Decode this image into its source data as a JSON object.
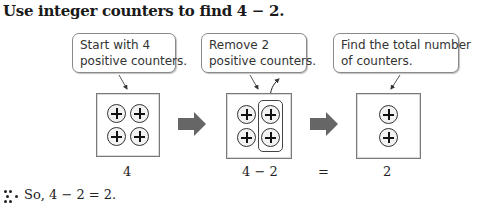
{
  "heading": "Use integer counters to find 4 − 2.",
  "steps": [
    {
      "callout_lines": [
        "Start with 4",
        "positive counters."
      ],
      "counters": [
        "+",
        "+",
        "+",
        "+"
      ],
      "label": "4"
    },
    {
      "callout_lines": [
        "Remove 2",
        "positive counters."
      ],
      "counters": [
        "+",
        "+",
        "+",
        "+"
      ],
      "removed_group": [
        "+",
        "+"
      ],
      "label": "4 − 2"
    },
    {
      "callout_lines": [
        "Find the total number",
        "of counters."
      ],
      "counters": [
        "+",
        "+"
      ],
      "label": "2"
    }
  ],
  "equals_sign": "=",
  "conclusion": {
    "marker_icon": "therefore-dots-icon",
    "text": "So, 4 − 2 = 2."
  },
  "colors": {
    "arrow": "#666666",
    "box_border": "#7a7a7a",
    "counter_fill": "#f2f2f2"
  }
}
